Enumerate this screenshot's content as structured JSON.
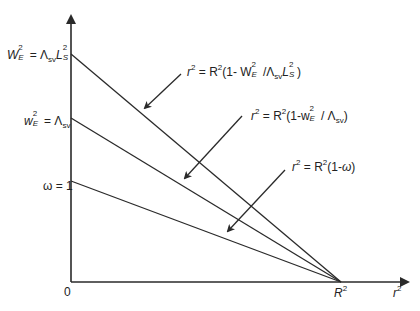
{
  "diagram": {
    "type": "line-plot-diagram",
    "colors": {
      "line": "#2a2a2a",
      "text": "#222222",
      "background": "#ffffff"
    },
    "axes": {
      "x_label": "r²",
      "y_label": "",
      "origin_label": "0",
      "x_intercept_label": "R²"
    },
    "y_tick_labels": {
      "top": {
        "lhs": "W",
        "sup": "2",
        "sub": "E",
        "rhs_a": " = Λ",
        "rhs_a_sub": "sv",
        "rhs_b": "L",
        "rhs_b_sup": "2",
        "rhs_b_sub": "S"
      },
      "middle": {
        "lhs": "w",
        "sup": "2",
        "sub": "E",
        "rhs": " = Λ",
        "rhs_sub": "sv"
      },
      "bottom": {
        "text": "ω = 1"
      }
    },
    "equations": [
      {
        "id": "eq1",
        "prefix": "r",
        "prefix_sup": "2",
        "mid": " = R",
        "mid_sup": "2",
        "body_a": "(1- W",
        "body_sup": "2",
        "body_sub": "E",
        "body_b": "  /Λ",
        "body_b_sub": "sv",
        "body_c": "L",
        "body_c_sup": "2",
        "body_c_sub": "S",
        "close": ")"
      },
      {
        "id": "eq2",
        "prefix": "r",
        "prefix_sup": "2",
        "mid": " = R",
        "mid_sup": "2",
        "body_a": "(1-w",
        "body_sup": "2",
        "body_sub": "E",
        "body_b": " / Λ",
        "body_b_sub": "sv",
        "close": ")"
      },
      {
        "id": "eq3",
        "prefix": "r",
        "prefix_sup": "2",
        "mid": " = R",
        "mid_sup": "2",
        "body_a": "(1-",
        "body_omega": "ω",
        "close": ")"
      }
    ],
    "lines": [
      {
        "name": "line-top",
        "from": [
          71,
          54
        ],
        "to": [
          341,
          282
        ]
      },
      {
        "name": "line-middle",
        "from": [
          71,
          118
        ],
        "to": [
          341,
          282
        ]
      },
      {
        "name": "line-bottom",
        "from": [
          71,
          181
        ],
        "to": [
          341,
          282
        ]
      }
    ],
    "pointer_arrows": [
      {
        "name": "arrow-eq1",
        "from": [
          181,
          74
        ],
        "to": [
          143,
          110
        ]
      },
      {
        "name": "arrow-eq2",
        "from": [
          242,
          116
        ],
        "to": [
          183,
          180
        ]
      },
      {
        "name": "arrow-eq3",
        "from": [
          285,
          170
        ],
        "to": [
          226,
          233
        ]
      }
    ]
  }
}
